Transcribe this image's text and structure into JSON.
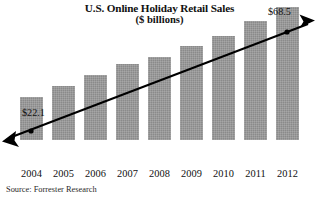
{
  "chart_data": {
    "type": "bar",
    "title": "U.S. Online Holiday Retail Sales",
    "subtitle": "($ billions)",
    "xlabel": "",
    "ylabel": "",
    "categories": [
      "2004",
      "2005",
      "2006",
      "2007",
      "2008",
      "2009",
      "2010",
      "2011",
      "2012"
    ],
    "values": [
      22.1,
      27.8,
      33.5,
      39.0,
      43.0,
      48.5,
      53.5,
      61.5,
      68.5
    ],
    "ylim": [
      0,
      72
    ],
    "grid": false,
    "legend": null,
    "bar_color": "#8a8a8a",
    "annotations": [
      {
        "name": "start-value",
        "text": "$22.1",
        "value": 22.1,
        "category": "2004"
      },
      {
        "name": "end-value",
        "text": "$68.5",
        "value": 68.5,
        "category": "2012"
      },
      {
        "name": "trend-line",
        "text": "",
        "style": "double-headed-arrow",
        "color": "#000000"
      }
    ],
    "source": "Source: Forrester Research"
  },
  "labels": {
    "title": "U.S. Online Holiday Retail Sales",
    "subtitle": "($ billions)",
    "source": "Source: Forrester Research",
    "callout_start": "$22.1",
    "callout_end": "$68.5"
  },
  "x_ticks": [
    "2004",
    "2005",
    "2006",
    "2007",
    "2008",
    "2009",
    "2010",
    "2011",
    "2012"
  ]
}
